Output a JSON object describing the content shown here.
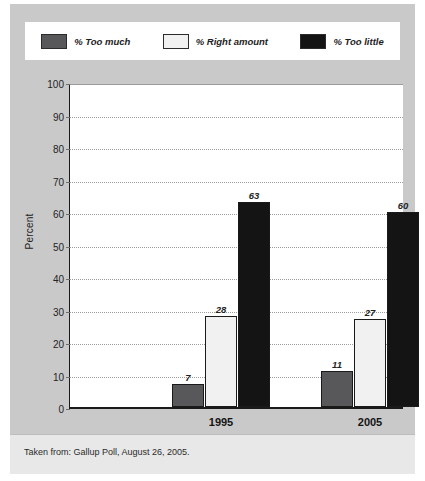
{
  "chart_data": {
    "type": "bar",
    "title": "",
    "xlabel": "",
    "ylabel": "Percent",
    "ylim": [
      0,
      100
    ],
    "ytick_step": 10,
    "yticks": [
      "100",
      "90",
      "80",
      "70",
      "60",
      "50",
      "40",
      "30",
      "20",
      "10",
      "0"
    ],
    "grid": true,
    "legend_position": "top",
    "categories": [
      "1995",
      "2005"
    ],
    "series": [
      {
        "name": "% Too much",
        "values": [
          7,
          28
        ]
      },
      {
        "name": "% Right amount",
        "values": [
          28,
          27
        ]
      },
      {
        "name": "% Too little",
        "values": [
          63,
          60
        ]
      }
    ],
    "groups": [
      {
        "category": "1995",
        "bars": [
          {
            "series": "% Too much",
            "value": 7,
            "label": "7",
            "color": "#58585a"
          },
          {
            "series": "% Right amount",
            "value": 28,
            "label": "28",
            "color": "#f1f1f1"
          },
          {
            "series": "% Too little",
            "value": 63,
            "label": "63",
            "color": "#141414"
          }
        ]
      },
      {
        "category": "2005",
        "bars": [
          {
            "series": "% Too much",
            "value": 11,
            "label": "11",
            "color": "#58585a"
          },
          {
            "series": "% Right amount",
            "value": 27,
            "label": "27",
            "color": "#f1f1f1"
          },
          {
            "series": "% Too little",
            "value": 60,
            "label": "60",
            "color": "#141414"
          }
        ]
      }
    ]
  },
  "legend": {
    "items": [
      {
        "label": "% Too much",
        "color": "#58585a"
      },
      {
        "label": "% Right amount",
        "color": "#f1f1f1"
      },
      {
        "label": "% Too little",
        "color": "#141414"
      }
    ]
  },
  "footer": {
    "source": "Taken from: Gallup Poll, August 26, 2005."
  }
}
